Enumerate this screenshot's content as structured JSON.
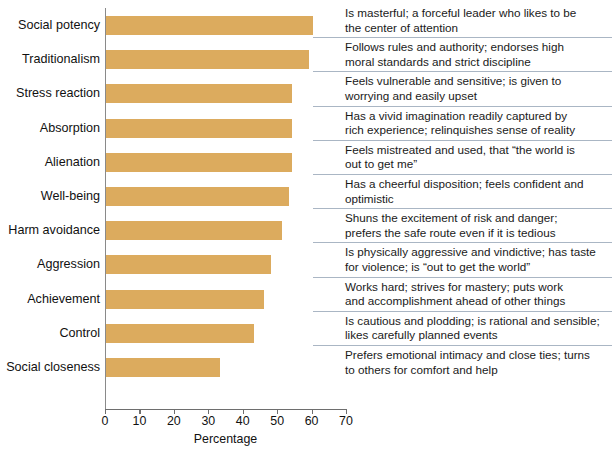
{
  "chart_data": {
    "type": "bar",
    "orientation": "horizontal",
    "title": "",
    "xlabel": "Percentage",
    "ylabel": "",
    "xlim": [
      0,
      70
    ],
    "xticks": [
      0,
      10,
      20,
      30,
      40,
      50,
      60,
      70
    ],
    "grid": false,
    "legend": null,
    "bar_color": "#dcab5e",
    "separator_color": "#aab6c4",
    "categories": [
      "Social potency",
      "Traditionalism",
      "Stress reaction",
      "Absorption",
      "Alienation",
      "Well-being",
      "Harm avoidance",
      "Aggression",
      "Achievement",
      "Control",
      "Social closeness"
    ],
    "values": [
      60,
      59,
      54,
      54,
      54,
      53,
      51,
      48,
      46,
      43,
      33
    ],
    "annotations": [
      "Is masterful; a forceful leader who likes to be the center of attention",
      "Follows rules and authority; endorses high moral standards and strict discipline",
      "Feels vulnerable and sensitive; is given to worrying and easily upset",
      "Has a vivid imagination readily captured by rich experience; relinquishes sense of reality",
      "Feels mistreated and used, that “the world is out to get me”",
      "Has a cheerful disposition; feels confident and optimistic",
      "Shuns the excitement of risk and danger; prefers the safe route even if it is tedious",
      "Is physically aggressive and vindictive; has taste for violence; is “out to get the world”",
      "Works hard; strives for mastery; puts work and accomplishment ahead of other things",
      "Is cautious and plodding; is rational and sensible; likes carefully planned events",
      "Prefers emotional intimacy and close ties; turns to others for comfort and help"
    ]
  },
  "descriptions": [
    {
      "line1": "Is masterful; a forceful leader who likes to be",
      "line2": "the center of attention"
    },
    {
      "line1": "Follows rules and authority; endorses high",
      "line2": "moral standards and strict discipline"
    },
    {
      "line1": "Feels vulnerable and sensitive; is given to",
      "line2": "worrying and easily upset"
    },
    {
      "line1": "Has a vivid imagination readily captured by",
      "line2": "rich experience; relinquishes sense of reality"
    },
    {
      "line1": "Feels mistreated and used, that “the world is",
      "line2": "out to get me”"
    },
    {
      "line1": "Has a cheerful disposition; feels confident and",
      "line2": "optimistic"
    },
    {
      "line1": "Shuns the excitement of risk and danger;",
      "line2": "prefers the safe route even if it is tedious"
    },
    {
      "line1": "Is physically aggressive and vindictive; has taste",
      "line2": "for violence; is “out to get the world”"
    },
    {
      "line1": "Works hard; strives for mastery; puts work",
      "line2": "and accomplishment ahead of other things"
    },
    {
      "line1": "Is cautious and plodding; is rational and sensible;",
      "line2": "likes carefully planned events"
    },
    {
      "line1": "Prefers emotional intimacy and close ties; turns",
      "line2": "to others for comfort and help"
    }
  ],
  "axis": {
    "title": "Percentage",
    "ticks": [
      "0",
      "10",
      "20",
      "30",
      "40",
      "50",
      "60",
      "70"
    ]
  }
}
